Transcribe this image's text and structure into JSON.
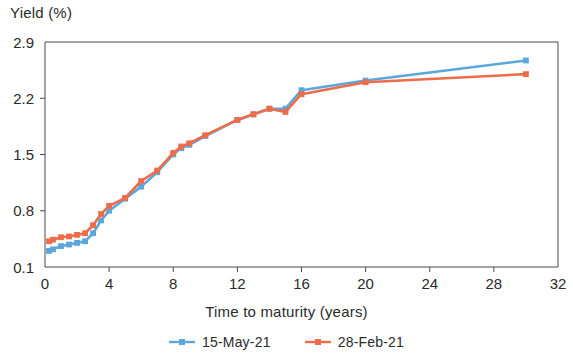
{
  "chart_data": {
    "type": "line",
    "title": "",
    "xlabel": "Time to maturity (years)",
    "ylabel": "Yield (%)",
    "xlim": [
      0,
      32
    ],
    "ylim": [
      0.1,
      2.9
    ],
    "xticks": [
      0,
      4,
      8,
      12,
      16,
      20,
      24,
      28,
      32
    ],
    "yticks": [
      0.1,
      0.8,
      1.5,
      2.2,
      2.9
    ],
    "grid": false,
    "legend_position": "bottom-center",
    "series": [
      {
        "name": "15-May-21",
        "color": "#5ba7dd",
        "marker": "square",
        "x": [
          0.25,
          0.5,
          1,
          1.5,
          2,
          2.5,
          3,
          3.5,
          4,
          5,
          6,
          7,
          8,
          8.5,
          9,
          10,
          12,
          13,
          14,
          15,
          16,
          20,
          30
        ],
        "y": [
          0.3,
          0.32,
          0.36,
          0.38,
          0.4,
          0.42,
          0.52,
          0.68,
          0.8,
          0.95,
          1.1,
          1.28,
          1.5,
          1.58,
          1.62,
          1.73,
          1.93,
          2.0,
          2.07,
          2.07,
          2.3,
          2.42,
          2.67
        ]
      },
      {
        "name": "28-Feb-21",
        "color": "#ef6c4a",
        "marker": "square",
        "x": [
          0.25,
          0.5,
          1,
          1.5,
          2,
          2.5,
          3,
          3.5,
          4,
          5,
          6,
          7,
          8,
          8.5,
          9,
          10,
          12,
          13,
          14,
          15,
          16,
          20,
          30
        ],
        "y": [
          0.42,
          0.44,
          0.47,
          0.48,
          0.5,
          0.52,
          0.62,
          0.76,
          0.86,
          0.96,
          1.17,
          1.3,
          1.52,
          1.6,
          1.64,
          1.74,
          1.93,
          2.0,
          2.07,
          2.03,
          2.25,
          2.4,
          2.5
        ]
      }
    ]
  },
  "axes": {
    "y_title": "Yield (%)",
    "x_title": "Time to maturity (years)"
  },
  "legend": {
    "items": [
      {
        "label": "15-May-21",
        "color": "#5ba7dd"
      },
      {
        "label": "28-Feb-21",
        "color": "#ef6c4a"
      }
    ]
  }
}
